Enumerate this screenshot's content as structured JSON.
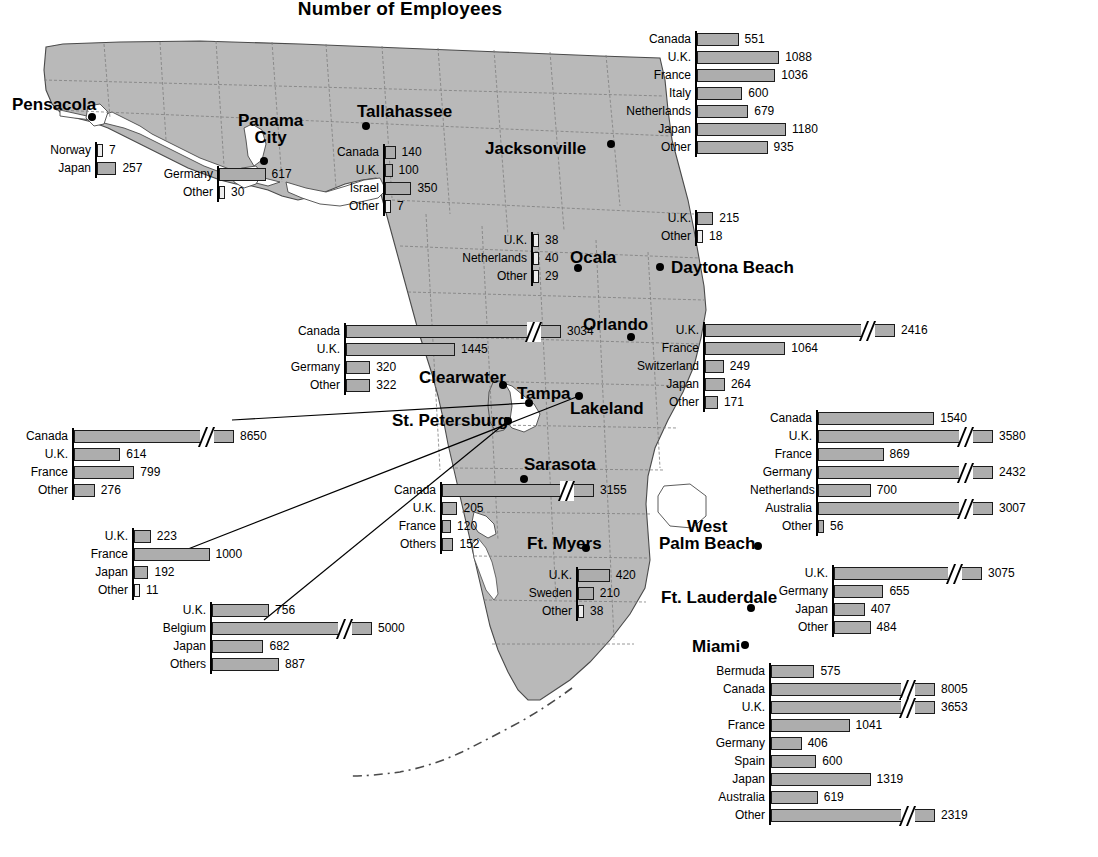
{
  "title": {
    "line1": "Employment by Foreign-Owned Firms, 1986",
    "line2": "Number of Employees"
  },
  "cities": [
    {
      "name": "Pensacola",
      "lines": [
        "Pensacola"
      ],
      "x": 12,
      "y": 96,
      "dot": [
        92,
        117
      ]
    },
    {
      "name": "Panama City",
      "lines": [
        "Panama",
        "City"
      ],
      "x": 238,
      "y": 112,
      "dot": [
        264,
        161
      ]
    },
    {
      "name": "Tallahassee",
      "lines": [
        "Tallahassee"
      ],
      "x": 357,
      "y": 103,
      "dot": [
        366,
        126
      ]
    },
    {
      "name": "Jacksonville",
      "lines": [
        "Jacksonville"
      ],
      "x": 485,
      "y": 140,
      "dot": [
        611,
        144
      ]
    },
    {
      "name": "Ocala",
      "lines": [
        "Ocala"
      ],
      "x": 570,
      "y": 249,
      "dot": [
        578,
        268
      ]
    },
    {
      "name": "Daytona Beach",
      "lines": [
        "Daytona Beach"
      ],
      "x": 671,
      "y": 259,
      "dot": [
        660,
        267
      ]
    },
    {
      "name": "Orlando",
      "lines": [
        "Orlando"
      ],
      "x": 583,
      "y": 316,
      "dot": [
        631,
        337
      ]
    },
    {
      "name": "Clearwater",
      "lines": [
        "Clearwater"
      ],
      "x": 419,
      "y": 369,
      "dot": [
        503,
        385
      ]
    },
    {
      "name": "Tampa",
      "lines": [
        "Tampa"
      ],
      "x": 517,
      "y": 385,
      "dot": [
        529,
        403
      ]
    },
    {
      "name": "Lakeland",
      "lines": [
        "Lakeland"
      ],
      "x": 570,
      "y": 400,
      "dot": [
        579,
        396
      ]
    },
    {
      "name": "St. Petersburg",
      "lines": [
        "St. Petersburg"
      ],
      "x": 392,
      "y": 412,
      "dot": [
        508,
        421
      ]
    },
    {
      "name": "Sarasota",
      "lines": [
        "Sarasota"
      ],
      "x": 524,
      "y": 456,
      "dot": [
        524,
        479
      ]
    },
    {
      "name": "Ft. Myers",
      "lines": [
        "Ft. Myers"
      ],
      "x": 527,
      "y": 535,
      "dot": [
        586,
        548
      ]
    },
    {
      "name": "West Palm Beach",
      "lines": [
        "West",
        "Palm Beach"
      ],
      "x": 659,
      "y": 518,
      "dot": [
        758,
        546
      ]
    },
    {
      "name": "Ft. Lauderdale",
      "lines": [
        "Ft. Lauderdale"
      ],
      "x": 661,
      "y": 589,
      "dot": [
        751,
        608
      ]
    },
    {
      "name": "Miami",
      "lines": [
        "Miami"
      ],
      "x": 692,
      "y": 638,
      "dot": [
        745,
        645
      ]
    }
  ],
  "chart_data": [
    {
      "id": "pensacola",
      "type": "bar",
      "city": "Pensacola",
      "x": 95,
      "y": 142,
      "label_w": 50,
      "scale": 0.0755,
      "max_px": 60,
      "categories": [
        "Norway",
        "Japan"
      ],
      "values": [
        7,
        257
      ],
      "breaks": [
        false,
        false
      ]
    },
    {
      "id": "panama-city",
      "type": "bar",
      "city": "Panama City",
      "x": 217,
      "y": 166,
      "label_w": 55,
      "scale": 0.0755,
      "max_px": 60,
      "categories": [
        "Germany",
        "Other"
      ],
      "values": [
        617,
        30
      ],
      "breaks": [
        false,
        false
      ]
    },
    {
      "id": "tallahassee",
      "type": "bar",
      "city": "Tallahassee",
      "x": 383,
      "y": 144,
      "label_w": 48,
      "scale": 0.0755,
      "max_px": 60,
      "categories": [
        "Canada",
        "U.K.",
        "Israel",
        "Other"
      ],
      "values": [
        140,
        100,
        350,
        7
      ],
      "breaks": [
        false,
        false,
        false,
        false
      ]
    },
    {
      "id": "jacksonville",
      "type": "bar",
      "city": "Jacksonville",
      "x": 695,
      "y": 31,
      "label_w": 65,
      "scale": 0.0755,
      "max_px": 95,
      "categories": [
        "Canada",
        "U.K.",
        "France",
        "Italy",
        "Netherlands",
        "Japan",
        "Other"
      ],
      "values": [
        551,
        1088,
        1036,
        600,
        679,
        1180,
        935
      ],
      "breaks": [
        false,
        false,
        false,
        false,
        false,
        false,
        false
      ]
    },
    {
      "id": "ocala",
      "type": "bar",
      "city": "Ocala",
      "x": 531,
      "y": 232,
      "label_w": 70,
      "scale": 0.0755,
      "max_px": 60,
      "categories": [
        "U.K.",
        "Netherlands",
        "Other"
      ],
      "values": [
        38,
        40,
        29
      ],
      "breaks": [
        false,
        false,
        false
      ]
    },
    {
      "id": "daytona-beach",
      "type": "bar",
      "city": "Daytona Beach",
      "x": 695,
      "y": 210,
      "label_w": 42,
      "scale": 0.0755,
      "max_px": 60,
      "categories": [
        "U.K.",
        "Other"
      ],
      "values": [
        215,
        18
      ],
      "breaks": [
        false,
        false
      ]
    },
    {
      "id": "orlando",
      "type": "bar",
      "city": "Orlando",
      "x": 703,
      "y": 322,
      "label_w": 68,
      "scale": 0.0755,
      "max_px": 190,
      "categories": [
        "U.K.",
        "France",
        "Switzerland",
        "Japan",
        "Other"
      ],
      "values": [
        2416,
        1064,
        249,
        264,
        171
      ],
      "breaks": [
        true,
        false,
        false,
        false,
        false
      ]
    },
    {
      "id": "clearwater",
      "type": "bar",
      "city": "Clearwater",
      "x": 344,
      "y": 323,
      "label_w": 55,
      "scale": 0.0755,
      "max_px": 215,
      "categories": [
        "Canada",
        "U.K.",
        "Germany",
        "Other"
      ],
      "values": [
        3034,
        1445,
        320,
        322
      ],
      "breaks": [
        true,
        false,
        false,
        false
      ]
    },
    {
      "id": "tampa",
      "type": "bar",
      "city": "Tampa",
      "x": 72,
      "y": 428,
      "label_w": 54,
      "scale": 0.0755,
      "max_px": 160,
      "categories": [
        "Canada",
        "U.K.",
        "France",
        "Other"
      ],
      "values": [
        8650,
        614,
        799,
        276
      ],
      "breaks": [
        true,
        false,
        false,
        false
      ]
    },
    {
      "id": "st-petersburg",
      "type": "bar",
      "city": "St. Petersburg",
      "x": 132,
      "y": 528,
      "label_w": 52,
      "scale": 0.0755,
      "max_px": 160,
      "categories": [
        "U.K.",
        "France",
        "Japan",
        "Other"
      ],
      "values": [
        223,
        1000,
        192,
        11
      ],
      "breaks": [
        false,
        false,
        false,
        false
      ]
    },
    {
      "id": "lakeland",
      "type": "bar",
      "city": "Lakeland",
      "x": 210,
      "y": 602,
      "label_w": 58,
      "scale": 0.0755,
      "max_px": 160,
      "categories": [
        "U.K.",
        "Belgium",
        "Japan",
        "Others"
      ],
      "values": [
        756,
        5000,
        682,
        887
      ],
      "breaks": [
        false,
        true,
        false,
        false
      ]
    },
    {
      "id": "sarasota",
      "type": "bar",
      "city": "Sarasota",
      "x": 440,
      "y": 482,
      "label_w": 52,
      "scale": 0.0755,
      "max_px": 152,
      "categories": [
        "Canada",
        "U.K.",
        "France",
        "Others"
      ],
      "values": [
        3155,
        205,
        120,
        152
      ],
      "breaks": [
        true,
        false,
        false,
        false
      ]
    },
    {
      "id": "ft-myers",
      "type": "bar",
      "city": "Ft. Myers",
      "x": 576,
      "y": 567,
      "label_w": 52,
      "scale": 0.0755,
      "max_px": 60,
      "categories": [
        "U.K.",
        "Sweden",
        "Other"
      ],
      "values": [
        420,
        210,
        38
      ],
      "breaks": [
        false,
        false,
        false
      ]
    },
    {
      "id": "west-palm-beach",
      "type": "bar",
      "city": "West Palm Beach",
      "x": 816,
      "y": 410,
      "label_w": 62,
      "scale": 0.0755,
      "max_px": 175,
      "categories": [
        "Canada",
        "U.K.",
        "France",
        "Germany",
        "Netherlands",
        "Australia",
        "Other"
      ],
      "values": [
        1540,
        3580,
        869,
        2432,
        700,
        3007,
        56
      ],
      "breaks": [
        false,
        true,
        false,
        true,
        false,
        true,
        false
      ]
    },
    {
      "id": "ft-lauderdale",
      "type": "bar",
      "city": "Ft. Lauderdale",
      "x": 832,
      "y": 565,
      "label_w": 62,
      "scale": 0.0755,
      "max_px": 148,
      "categories": [
        "U.K.",
        "Germany",
        "Japan",
        "Other"
      ],
      "values": [
        3075,
        655,
        407,
        484
      ],
      "breaks": [
        true,
        false,
        false,
        false
      ]
    },
    {
      "id": "miami",
      "type": "bar",
      "city": "Miami",
      "x": 769,
      "y": 663,
      "label_w": 64,
      "scale": 0.0755,
      "max_px": 164,
      "categories": [
        "Bermuda",
        "Canada",
        "U.K.",
        "France",
        "Germany",
        "Spain",
        "Japan",
        "Australia",
        "Other"
      ],
      "values": [
        575,
        8005,
        3653,
        1041,
        406,
        600,
        1319,
        619,
        2319
      ],
      "breaks": [
        false,
        true,
        true,
        false,
        false,
        false,
        false,
        false,
        true
      ]
    }
  ],
  "connectors": [
    {
      "name": "tampa-connector",
      "x1": 232,
      "y1": 420,
      "x2": 529,
      "y2": 403
    },
    {
      "name": "lakeland-connector",
      "x1": 188,
      "y1": 549,
      "x2": 579,
      "y2": 396
    },
    {
      "name": "stpetersburg-connector",
      "x1": 264,
      "y1": 620,
      "x2": 508,
      "y2": 421
    }
  ],
  "colors": {
    "map_fill": "#b9b9b9",
    "map_stroke": "#4a4a4a",
    "bar_fill": "#adadad",
    "bar_stroke": "#1c1c1c",
    "text": "#000000",
    "background": "#ffffff"
  }
}
